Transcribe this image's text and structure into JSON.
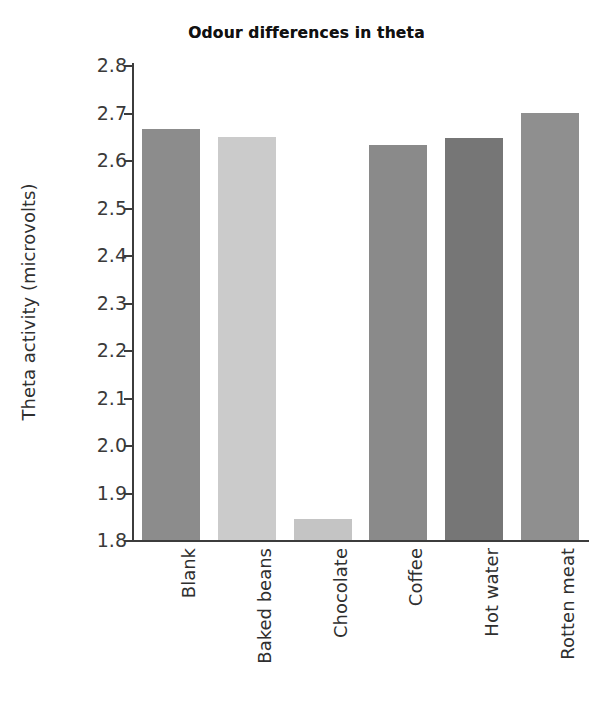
{
  "chart_data": {
    "type": "bar",
    "title": "Odour differences in theta",
    "xlabel": "",
    "ylabel": "Theta activity (microvolts)",
    "categories": [
      "Blank",
      "Baked beans",
      "Chocolate",
      "Coffee",
      "Hot water",
      "Rotten meat"
    ],
    "values": [
      2.665,
      2.648,
      1.845,
      2.632,
      2.647,
      2.7
    ],
    "bar_colors": [
      "#8c8c8c",
      "#cbcbcb",
      "#c4c4c4",
      "#8a8a8a",
      "#767676",
      "#8f8f8f"
    ],
    "ylim": [
      1.8,
      2.8
    ],
    "ytick_labels": [
      "2.8",
      "2.7",
      "2.6",
      "2.5",
      "2.4",
      "2.3",
      "2.2",
      "2.1",
      "2.0",
      "1.9",
      "1.8"
    ],
    "ytick_values": [
      2.8,
      2.7,
      2.6,
      2.5,
      2.4,
      2.3,
      2.2,
      2.1,
      2.0,
      1.9,
      1.8
    ],
    "grid": false,
    "legend": null,
    "axis_color": "#3c3c3c",
    "background_color": "#ffffff"
  }
}
